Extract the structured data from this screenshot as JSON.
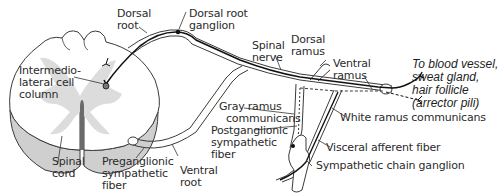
{
  "diagram": {
    "colors": {
      "outline": "#3a3a3a",
      "gray_matter": "#d9d9d9",
      "cord_side": "#c9c9c9",
      "fiber": "#1a1a1a",
      "text": "#2b2b2b"
    },
    "labels": {
      "dorsal_root": [
        "Dorsal",
        "root"
      ],
      "dorsal_root_ganglion": [
        "Dorsal root",
        "ganglion"
      ],
      "spinal_nerve": [
        "Spinal",
        "nerve"
      ],
      "dorsal_ramus": [
        "Dorsal",
        "ramus"
      ],
      "ventral_ramus": [
        "Ventral",
        "ramus"
      ],
      "target": [
        "To blood vessel,",
        "sweat gland,",
        "hair follicle",
        "(arrector pili)"
      ],
      "intermediolateral_cell_column": [
        "Intermedio-",
        "lateral cell",
        "column"
      ],
      "gray_ramus_communicans": [
        "Gray ramus",
        "communicans"
      ],
      "postganglionic_sympathetic_fiber": [
        "Postganglionic",
        "sympathetic",
        "fiber"
      ],
      "white_ramus_communicans": [
        "White ramus communicans"
      ],
      "visceral_afferent_fiber": [
        "Visceral afferent fiber"
      ],
      "sympathetic_chain_ganglion": [
        "Sympathetic chain ganglion"
      ],
      "spinal_cord": [
        "Spinal",
        "cord"
      ],
      "preganglionic_sympathetic_fiber": [
        "Preganglionic",
        "sympathetic",
        "fiber"
      ],
      "ventral_root": [
        "Ventral",
        "root"
      ]
    }
  }
}
